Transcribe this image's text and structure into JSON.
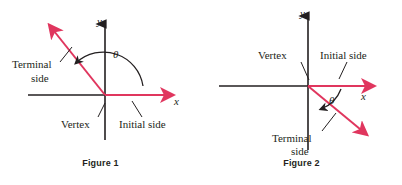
{
  "page": {
    "background_color": "#ffffff",
    "ray_color": "#e0365e",
    "axis_color": "#231f20",
    "text_color": "#231f20"
  },
  "figures": [
    {
      "caption": "Figure 1",
      "angle_symbol": "θ",
      "angle_direction": "counterclockwise",
      "axis_labels": {
        "x": "x",
        "y": "y"
      },
      "labels": {
        "terminal_line1": "Terminal",
        "terminal_line2": "side",
        "vertex": "Vertex",
        "initial": "Initial side"
      }
    },
    {
      "caption": "Figure 2",
      "angle_symbol": "θ",
      "angle_direction": "clockwise",
      "axis_labels": {
        "x": "x",
        "y": "y"
      },
      "labels": {
        "terminal_line1": "Terminal",
        "terminal_line2": "side",
        "vertex": "Vertex",
        "initial": "Initial side"
      }
    }
  ]
}
